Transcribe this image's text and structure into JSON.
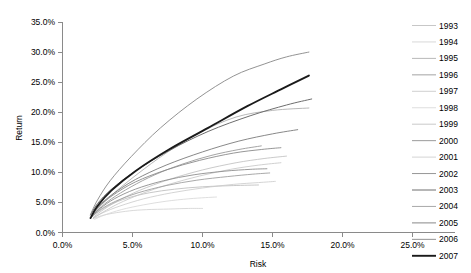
{
  "chart_data": {
    "type": "line",
    "title": "",
    "xlabel": "Risk",
    "ylabel": "Return",
    "xlim": [
      0.0,
      25.0
    ],
    "ylim": [
      0.0,
      35.0
    ],
    "xticks": [
      "0.0%",
      "5.0%",
      "10.0%",
      "15.0%",
      "20.0%",
      "25.0%"
    ],
    "xtick_values": [
      0.0,
      5.0,
      10.0,
      15.0,
      20.0,
      25.0
    ],
    "yticks": [
      "0.0%",
      "5.0%",
      "10.0%",
      "15.0%",
      "20.0%",
      "25.0%",
      "30.0%",
      "35.0%"
    ],
    "ytick_values": [
      0.0,
      5.0,
      10.0,
      15.0,
      20.0,
      25.0,
      30.0,
      35.0
    ],
    "grid": false,
    "legend_position": "right",
    "units": "percent",
    "series": [
      {
        "name": "1993",
        "color": "#b9b9b9",
        "width": 0.8,
        "x": [
          2.1,
          2.6,
          3.4,
          4.6,
          6.2,
          8.0,
          10.0,
          12.2,
          14.0
        ],
        "y": [
          2.6,
          3.5,
          4.6,
          5.7,
          6.6,
          7.2,
          7.6,
          7.8,
          7.9
        ]
      },
      {
        "name": "1994",
        "color": "#cfcfcf",
        "width": 0.8,
        "x": [
          2.2,
          2.8,
          3.6,
          4.8,
          6.0,
          7.6,
          9.0,
          10.0
        ],
        "y": [
          2.3,
          2.8,
          3.2,
          3.6,
          3.8,
          3.9,
          4.0,
          4.0
        ]
      },
      {
        "name": "1995",
        "color": "#a6a6a6",
        "width": 0.8,
        "x": [
          2.1,
          2.7,
          3.8,
          5.4,
          7.4,
          9.8,
          12.4,
          15.0,
          17.6
        ],
        "y": [
          2.7,
          4.4,
          6.8,
          9.8,
          13.2,
          16.6,
          19.2,
          20.3,
          20.7
        ]
      },
      {
        "name": "1996",
        "color": "#9a9a9a",
        "width": 0.9,
        "x": [
          2.1,
          2.6,
          3.5,
          4.9,
          6.6,
          8.6,
          10.6,
          12.6,
          14.2
        ],
        "y": [
          2.6,
          3.9,
          5.6,
          7.6,
          9.6,
          11.4,
          12.8,
          13.8,
          14.4
        ]
      },
      {
        "name": "1997",
        "color": "#c4c4c4",
        "width": 0.8,
        "x": [
          2.2,
          2.9,
          4.0,
          5.6,
          7.6,
          9.8,
          12.0,
          14.0,
          15.6
        ],
        "y": [
          2.4,
          3.4,
          4.8,
          6.4,
          8.0,
          9.4,
          10.5,
          11.2,
          11.6
        ]
      },
      {
        "name": "1998",
        "color": "#d6d6d6",
        "width": 0.8,
        "x": [
          2.3,
          3.0,
          4.2,
          5.8,
          7.4,
          9.0,
          10.2,
          11.0
        ],
        "y": [
          2.2,
          2.9,
          3.8,
          4.6,
          5.2,
          5.6,
          5.8,
          5.9
        ]
      },
      {
        "name": "1999",
        "color": "#bdbdbd",
        "width": 0.8,
        "x": [
          2.2,
          2.8,
          3.9,
          5.5,
          7.6,
          10.0,
          12.4,
          14.4,
          16.0
        ],
        "y": [
          2.5,
          3.6,
          5.2,
          7.0,
          8.8,
          10.4,
          11.6,
          12.3,
          12.7
        ]
      },
      {
        "name": "2000",
        "color": "#8e8e8e",
        "width": 0.9,
        "x": [
          2.1,
          2.7,
          3.7,
          5.2,
          7.2,
          9.4,
          11.6,
          13.4,
          14.6
        ],
        "y": [
          2.7,
          4.0,
          5.6,
          7.2,
          8.6,
          9.6,
          10.2,
          10.5,
          10.6
        ]
      },
      {
        "name": "2001",
        "color": "#c9c9c9",
        "width": 0.8,
        "x": [
          2.2,
          2.9,
          4.1,
          5.8,
          7.8,
          10.0,
          12.2,
          14.0,
          15.2
        ],
        "y": [
          2.4,
          3.3,
          4.4,
          5.6,
          6.6,
          7.4,
          8.0,
          8.3,
          8.5
        ]
      },
      {
        "name": "2002",
        "color": "#8a8a8a",
        "width": 0.9,
        "x": [
          2.1,
          2.6,
          3.6,
          5.2,
          7.4,
          9.8,
          12.2,
          14.2,
          15.6
        ],
        "y": [
          2.8,
          4.3,
          6.2,
          8.4,
          10.4,
          12.0,
          13.2,
          13.8,
          14.1
        ]
      },
      {
        "name": "2003",
        "color": "#6e6e6e",
        "width": 1.0,
        "x": [
          2.0,
          2.5,
          3.5,
          5.2,
          7.6,
          10.4,
          13.4,
          16.0,
          17.8
        ],
        "y": [
          2.9,
          4.8,
          7.2,
          10.2,
          13.6,
          16.8,
          19.4,
          21.2,
          22.2
        ]
      },
      {
        "name": "2004",
        "color": "#9f9f9f",
        "width": 0.9,
        "x": [
          2.1,
          2.7,
          3.8,
          5.4,
          7.4,
          9.6,
          11.8,
          13.6,
          14.8
        ],
        "y": [
          2.6,
          3.8,
          5.2,
          6.6,
          7.8,
          8.7,
          9.3,
          9.7,
          9.9
        ]
      },
      {
        "name": "2005",
        "color": "#7a7a7a",
        "width": 0.9,
        "x": [
          2.1,
          2.6,
          3.6,
          5.2,
          7.4,
          10.0,
          12.6,
          15.0,
          16.8
        ],
        "y": [
          2.8,
          4.4,
          6.4,
          8.8,
          11.2,
          13.4,
          15.2,
          16.4,
          17.1
        ]
      },
      {
        "name": "2006",
        "color": "#878787",
        "width": 0.9,
        "x": [
          2.0,
          2.5,
          3.4,
          4.9,
          7.0,
          9.6,
          12.2,
          14.4,
          16.0,
          17.6
        ],
        "y": [
          3.0,
          5.4,
          8.6,
          12.6,
          17.4,
          22.2,
          26.0,
          28.0,
          29.2,
          30.0
        ]
      },
      {
        "name": "2007",
        "color": "#1a1a1a",
        "width": 1.9,
        "x": [
          2.0,
          2.5,
          3.5,
          5.2,
          7.6,
          10.4,
          13.2,
          15.6,
          17.6
        ],
        "y": [
          2.4,
          4.4,
          7.0,
          10.2,
          13.8,
          17.4,
          21.0,
          23.8,
          26.1
        ]
      }
    ]
  },
  "legend": {
    "entries": [
      {
        "label": "1993"
      },
      {
        "label": "1994"
      },
      {
        "label": "1995"
      },
      {
        "label": "1996"
      },
      {
        "label": "1997"
      },
      {
        "label": "1998"
      },
      {
        "label": "1999"
      },
      {
        "label": "2000"
      },
      {
        "label": "2001"
      },
      {
        "label": "2002"
      },
      {
        "label": "2003"
      },
      {
        "label": "2004"
      },
      {
        "label": "2005"
      },
      {
        "label": "2006"
      },
      {
        "label": "2007"
      }
    ]
  },
  "colors": {
    "background": "#ffffff",
    "axis": "#8a8a8a",
    "text": "#000000",
    "highlight_series": "#1a1a1a"
  }
}
